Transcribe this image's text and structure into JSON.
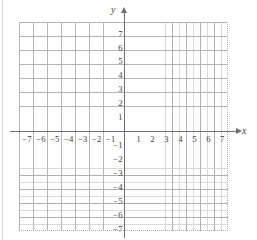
{
  "figure": {
    "name": "cartesian-coordinate-plane",
    "x_axis_label": "x",
    "y_axis_label": "y",
    "colors": {
      "background": "#ffffff",
      "major_gridline": "#a9a9a9",
      "minor_gridline": "#bdbdbd",
      "axis": "#6f6f6f",
      "tick_label": "#3c3c3c"
    }
  },
  "chart_data": {
    "type": "scatter",
    "title": "",
    "subtitle": "",
    "xlabel": "x",
    "ylabel": "y",
    "xlim": [
      -7.5,
      7.5
    ],
    "ylim": [
      -7.5,
      7.5
    ],
    "grid": true,
    "minor_grid": true,
    "minor_tick_step": 0.5,
    "tick_step": 1,
    "legend": null,
    "series": [],
    "annotations": [],
    "x_ticks": [
      -7,
      -6,
      -5,
      -4,
      -3,
      -2,
      -1,
      1,
      2,
      3,
      4,
      5,
      6,
      7
    ],
    "y_ticks": [
      7,
      6,
      5,
      4,
      3,
      2,
      1,
      -1,
      -2,
      -3,
      -4,
      -5,
      -6,
      -7
    ],
    "x_tick_labels": [
      "−7",
      "−6",
      "−5",
      "−4",
      "−3",
      "−2",
      "−1",
      "1",
      "2",
      "3",
      "4",
      "5",
      "6",
      "7"
    ],
    "y_tick_labels": [
      "7",
      "6",
      "5",
      "4",
      "3",
      "2",
      "1",
      "−1",
      "−2",
      "−3",
      "−4",
      "−5",
      "−6",
      "−7"
    ]
  }
}
